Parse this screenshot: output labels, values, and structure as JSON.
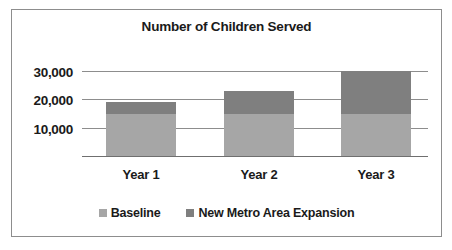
{
  "chart_data": {
    "type": "bar",
    "subtype": "stacked-column",
    "title": "Number of Children Served",
    "xlabel": "",
    "ylabel": "",
    "categories": [
      "Year 1",
      "Year 2",
      "Year 3"
    ],
    "series": [
      {
        "name": "Baseline",
        "color": "#a6a6a6",
        "values": [
          15000,
          15000,
          15000
        ]
      },
      {
        "name": "New Metro Area Expansion",
        "color": "#7f7f7f",
        "values": [
          4000,
          8000,
          15000
        ]
      }
    ],
    "totals": [
      19000,
      23000,
      30000
    ],
    "ylim": [
      0,
      30000
    ],
    "yticks": [
      30000,
      20000,
      10000
    ],
    "ytick_labels": [
      "30,000",
      "20,000",
      "10,000"
    ],
    "grid": true,
    "legend_position": "bottom",
    "legend": [
      {
        "label": "Baseline",
        "color": "#a6a6a6"
      },
      {
        "label": "New Metro Area Expansion",
        "color": "#7f7f7f"
      }
    ],
    "colors": {
      "baseline": "#a6a6a6",
      "expansion": "#7f7f7f",
      "gridline": "#8d8d8d",
      "axis": "#6f6f6f",
      "frame_border": "#8d8d8d",
      "text": "#1a1a1a",
      "background": "#ffffff"
    }
  }
}
